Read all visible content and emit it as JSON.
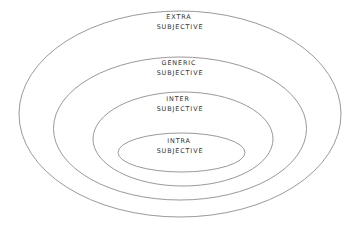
{
  "diagram": {
    "type": "concentric-ellipses",
    "background_color": "#ffffff",
    "stroke_color": "#8d8d93",
    "text_color": "#2d2d30",
    "rings": [
      {
        "name": "extra-subjective",
        "label_line1": "EXTRA",
        "label_line2": "SUBJECTIVE",
        "cx": 180,
        "cy": 114,
        "rx": 161,
        "ry": 103
      },
      {
        "name": "generic-subjective",
        "label_line1": "GENERIC",
        "label_line2": "SUBJECTIVE",
        "cx": 180,
        "cy": 128.5,
        "rx": 126.5,
        "ry": 71.5
      },
      {
        "name": "inter-subjective",
        "label_line1": "INTER",
        "label_line2": "SUBJECTIVE",
        "cx": 183,
        "cy": 139,
        "rx": 90,
        "ry": 47
      },
      {
        "name": "intra-subjective",
        "label_line1": "INTRA",
        "label_line2": "SUBJECTIVE",
        "cx": 181.5,
        "cy": 152.5,
        "rx": 63.5,
        "ry": 19.5
      }
    ]
  }
}
